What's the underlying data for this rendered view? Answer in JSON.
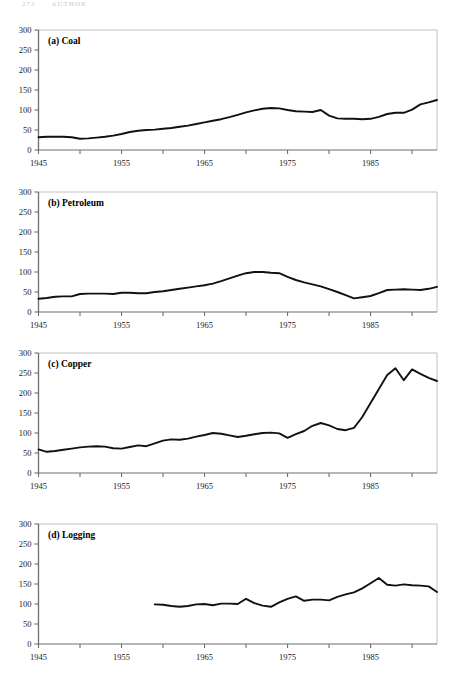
{
  "page": {
    "header_left": "272",
    "header_right": "AUTHOR"
  },
  "axis": {
    "y_ticks": [
      0,
      50,
      100,
      150,
      200,
      250,
      300
    ],
    "y_tick_labels": [
      "0",
      "50",
      "100",
      "150",
      "200",
      "250",
      "300"
    ],
    "x_tick_labels": [
      "1945",
      "1955",
      "1965",
      "1975",
      "1985"
    ],
    "x_label_years": [
      1945,
      1955,
      1965,
      1975,
      1985
    ],
    "x_minor_years": [
      1950,
      1960,
      1970,
      1980,
      1990
    ],
    "xlim": [
      1945,
      1993
    ],
    "ylim": [
      0,
      300
    ]
  },
  "panels": [
    {
      "key": "coal",
      "label": "(a) Coal"
    },
    {
      "key": "petroleum",
      "label": "(b) Petroleum"
    },
    {
      "key": "copper",
      "label": "(c) Copper"
    },
    {
      "key": "logging",
      "label": "(d) Logging"
    }
  ],
  "chart_data": [
    {
      "type": "line",
      "title": "(a) Coal",
      "xlabel": "",
      "ylabel": "",
      "xlim": [
        1945,
        1993
      ],
      "ylim": [
        0,
        300
      ],
      "grid": false,
      "legend": "none",
      "x": [
        1945,
        1946,
        1947,
        1948,
        1949,
        1950,
        1951,
        1952,
        1953,
        1954,
        1955,
        1956,
        1957,
        1958,
        1959,
        1960,
        1961,
        1962,
        1963,
        1964,
        1965,
        1966,
        1967,
        1968,
        1969,
        1970,
        1971,
        1972,
        1973,
        1974,
        1975,
        1976,
        1977,
        1978,
        1979,
        1980,
        1981,
        1982,
        1983,
        1984,
        1985,
        1986,
        1987,
        1988,
        1989,
        1990,
        1991,
        1992,
        1993
      ],
      "values": [
        32,
        33,
        33,
        33,
        32,
        28,
        29,
        31,
        33,
        36,
        40,
        45,
        48,
        50,
        51,
        53,
        55,
        58,
        61,
        65,
        69,
        73,
        77,
        82,
        88,
        94,
        99,
        103,
        105,
        104,
        100,
        97,
        96,
        95,
        100,
        86,
        79,
        78,
        78,
        77,
        78,
        83,
        90,
        93,
        93,
        101,
        114,
        119,
        125,
        140,
        157,
        172,
        190,
        205,
        219
      ]
    },
    {
      "type": "line",
      "title": "(b) Petroleum",
      "xlabel": "",
      "ylabel": "",
      "xlim": [
        1945,
        1993
      ],
      "ylim": [
        0,
        300
      ],
      "grid": false,
      "legend": "none",
      "x": [
        1945,
        1946,
        1947,
        1948,
        1949,
        1950,
        1951,
        1952,
        1953,
        1954,
        1955,
        1956,
        1957,
        1958,
        1959,
        1960,
        1961,
        1962,
        1963,
        1964,
        1965,
        1966,
        1967,
        1968,
        1969,
        1970,
        1971,
        1972,
        1973,
        1974,
        1975,
        1976,
        1977,
        1978,
        1979,
        1980,
        1981,
        1982,
        1983,
        1984,
        1985,
        1986,
        1987,
        1988,
        1989,
        1990,
        1991,
        1992,
        1993
      ],
      "values": [
        33,
        35,
        38,
        39,
        39,
        45,
        46,
        46,
        46,
        45,
        48,
        48,
        47,
        47,
        50,
        52,
        55,
        58,
        61,
        64,
        67,
        71,
        77,
        84,
        91,
        97,
        100,
        100,
        98,
        97,
        88,
        80,
        74,
        69,
        64,
        57,
        50,
        42,
        34,
        37,
        40,
        47,
        55,
        56,
        57,
        56,
        55,
        58,
        63,
        64,
        65
      ]
    },
    {
      "type": "line",
      "title": "(c) Copper",
      "xlabel": "",
      "ylabel": "",
      "xlim": [
        1945,
        1993
      ],
      "ylim": [
        0,
        300
      ],
      "grid": false,
      "legend": "none",
      "x": [
        1945,
        1946,
        1947,
        1948,
        1949,
        1950,
        1951,
        1952,
        1953,
        1954,
        1955,
        1956,
        1957,
        1958,
        1959,
        1960,
        1961,
        1962,
        1963,
        1964,
        1965,
        1966,
        1967,
        1968,
        1969,
        1970,
        1971,
        1972,
        1973,
        1974,
        1975,
        1976,
        1977,
        1978,
        1979,
        1980,
        1981,
        1982,
        1983,
        1984,
        1985,
        1986,
        1987,
        1988,
        1989,
        1990,
        1991,
        1992,
        1993
      ],
      "values": [
        59,
        53,
        55,
        58,
        61,
        64,
        66,
        67,
        66,
        62,
        61,
        65,
        69,
        67,
        74,
        81,
        84,
        83,
        86,
        91,
        95,
        100,
        98,
        94,
        90,
        93,
        97,
        100,
        101,
        99,
        88,
        97,
        105,
        118,
        125,
        119,
        110,
        107,
        113,
        140,
        175,
        210,
        245,
        262,
        232,
        259,
        248,
        238,
        230,
        266,
        270,
        282
      ]
    },
    {
      "type": "line",
      "title": "(d) Logging",
      "xlabel": "",
      "ylabel": "",
      "xlim": [
        1945,
        1993
      ],
      "ylim": [
        0,
        300
      ],
      "grid": false,
      "legend": "none",
      "series_start_year": 1959,
      "x": [
        1959,
        1960,
        1961,
        1962,
        1963,
        1964,
        1965,
        1966,
        1967,
        1968,
        1969,
        1970,
        1971,
        1972,
        1973,
        1974,
        1975,
        1976,
        1977,
        1978,
        1979,
        1980,
        1981,
        1982,
        1983,
        1984,
        1985,
        1986,
        1987,
        1988,
        1989,
        1990,
        1991,
        1992,
        1993
      ],
      "values": [
        99,
        98,
        95,
        93,
        95,
        99,
        100,
        97,
        101,
        101,
        100,
        113,
        102,
        96,
        93,
        104,
        113,
        119,
        108,
        111,
        111,
        109,
        118,
        124,
        129,
        139,
        152,
        165,
        148,
        146,
        149,
        147,
        146,
        144,
        130
      ]
    }
  ]
}
